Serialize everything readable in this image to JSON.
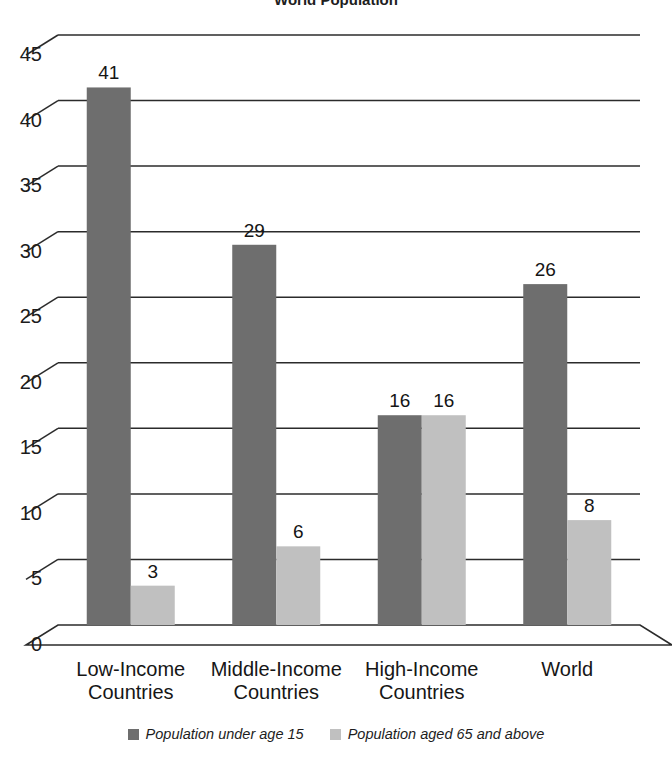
{
  "chart_data": {
    "type": "bar",
    "title": "World Population",
    "xlabel": "",
    "ylabel": "",
    "ylim": [
      0,
      45
    ],
    "yticks": [
      0,
      5,
      10,
      15,
      20,
      25,
      30,
      35,
      40,
      45
    ],
    "grid": true,
    "legend_position": "bottom",
    "style": "3d-clustered-column",
    "categories": [
      "Low-Income Countries",
      "Middle-Income Countries",
      "High-Income Countries",
      "World"
    ],
    "category_lines": [
      [
        "Low-Income",
        "Countries"
      ],
      [
        "Middle-Income",
        "Countries"
      ],
      [
        "High-Income",
        "Countries"
      ],
      [
        "World"
      ]
    ],
    "series": [
      {
        "name": "Population under age 15",
        "color": "#6e6e6e",
        "values": [
          41,
          29,
          16,
          26
        ]
      },
      {
        "name": "Population aged 65 and above",
        "color": "#c0c0c0",
        "values": [
          3,
          6,
          16,
          8
        ]
      }
    ]
  },
  "legend": {
    "entries": [
      {
        "label": "Population under age 15",
        "color": "#6e6e6e"
      },
      {
        "label": "Population aged 65 and above",
        "color": "#c0c0c0"
      }
    ]
  },
  "colors": {
    "series_dark": "#6e6e6e",
    "series_light": "#c0c0c0",
    "gridline": "#2b2b2b",
    "axis": "#2b2b2b",
    "background": "#ffffff",
    "text": "#1a1a1a"
  }
}
